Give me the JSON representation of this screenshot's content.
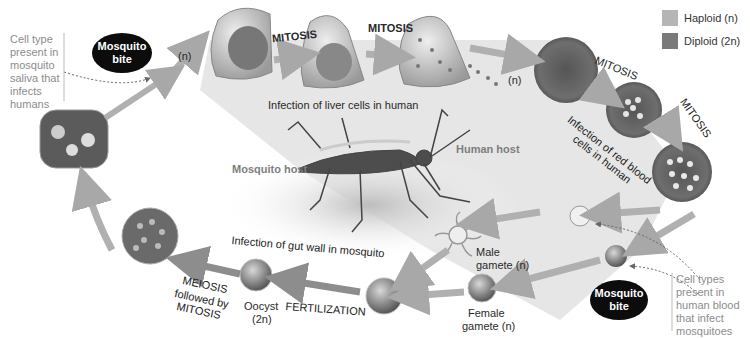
{
  "diagram": {
    "legend": [
      {
        "label": "Haploid (n)",
        "color": "#b5b5b5"
      },
      {
        "label": "Diploid (2n)",
        "color": "#7a7a7a"
      }
    ],
    "hosts": {
      "mosquito": "Mosquito host",
      "human": "Human host"
    },
    "notes": {
      "saliva": "Cell type\npresent in\nmosquito\nsaliva that\ninfects\nhumans",
      "blood": "Cell types\npresent in\nhuman blood\nthat infect\nmosquitoes"
    },
    "bites": {
      "top": "Mosquito\nbite",
      "bottom": "Mosquito\nbite"
    },
    "stage_labels": {
      "n_top": "(n)",
      "n_liver": "(n)",
      "mitosis_1": "MITOSIS",
      "mitosis_2": "MITOSIS",
      "mitosis_3": "MITOSIS",
      "mitosis_4": "MITOSIS",
      "liver": "Infection of liver cells in human",
      "rbc": "Infection of red blood cells in human",
      "gut": "Infection of gut wall in mosquito",
      "male_gamete_1": "Male",
      "male_gamete_2": "gamete (n)",
      "female_gamete_1": "Female",
      "female_gamete_2": "gamete (n)",
      "fertilization": "FERTILIZATION",
      "oocyst_1": "Oocyst",
      "oocyst_2": "(2n)",
      "meiosis": "MEIOSIS",
      "meiosis_sub_1": "followed by",
      "meiosis_sub_2": "MITOSIS"
    }
  }
}
